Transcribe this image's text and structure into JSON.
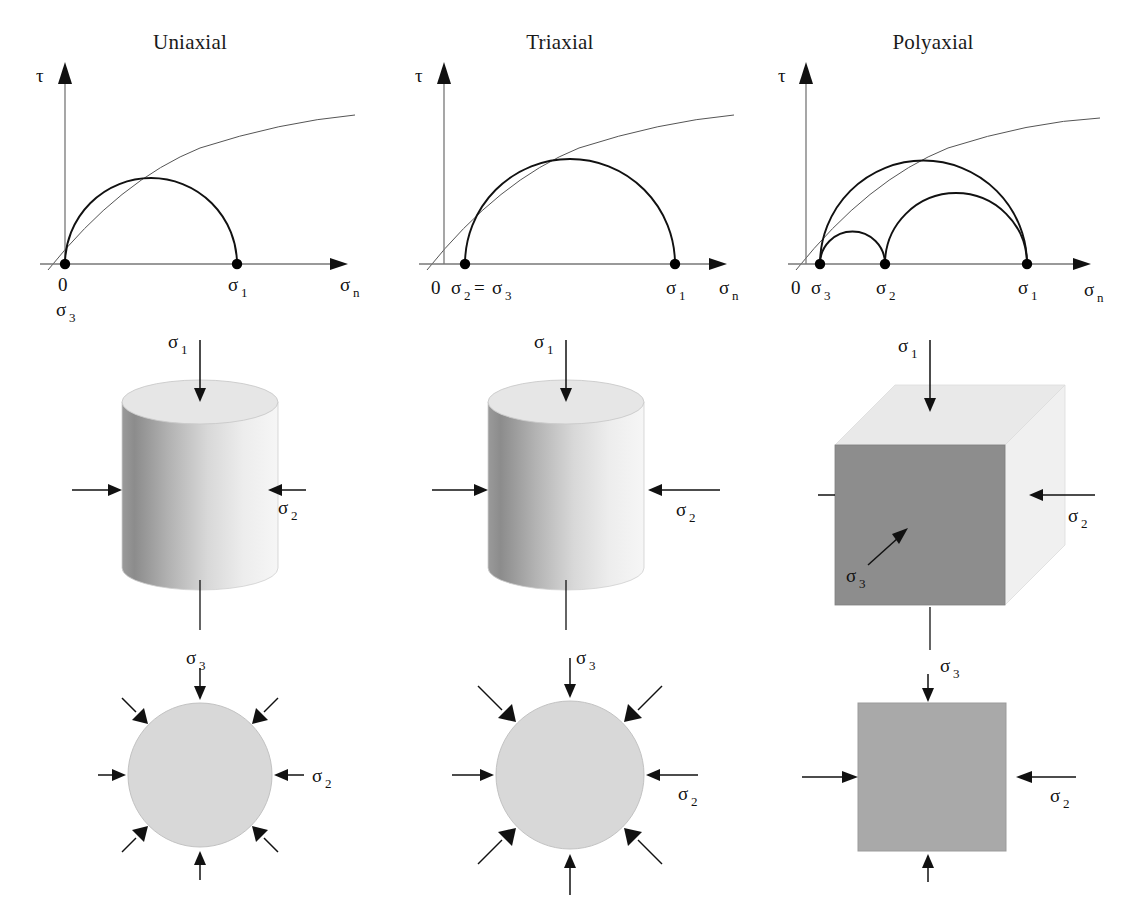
{
  "columns": [
    {
      "key": "uniaxial",
      "title": "Uniaxial",
      "mohr": {
        "tau_label": "τ",
        "sigma_n_label": "σ",
        "sigma_n_sub": "n",
        "origin_label": "0",
        "points": [
          {
            "name": "sigma3",
            "base": "σ",
            "sub": "3",
            "value": 0,
            "label_below_origin": true
          },
          {
            "name": "sigma1",
            "base": "σ",
            "sub": "1",
            "value": 172
          }
        ],
        "circles": [
          {
            "from": 0,
            "to": 172
          }
        ]
      },
      "solid": {
        "shape": "cylinder",
        "axial": {
          "base": "σ",
          "sub": "1"
        },
        "lateral": {
          "base": "σ",
          "sub": "2"
        },
        "lateral_arrow_length": "short"
      },
      "section": {
        "shape": "circle",
        "top": {
          "base": "σ",
          "sub": "3"
        },
        "side": {
          "base": "σ",
          "sub": "2"
        },
        "arrow_count": 8,
        "arrow_length": "short"
      }
    },
    {
      "key": "triaxial",
      "title": "Triaxial",
      "mohr": {
        "tau_label": "τ",
        "sigma_n_label": "σ",
        "sigma_n_sub": "n",
        "origin_label": "0",
        "equality_label": "σ₂ = σ₃",
        "points": [
          {
            "name": "sigma2_sigma3",
            "base": "σ",
            "sub": "2",
            "base2": "σ",
            "sub2": "3",
            "joiner": "=",
            "value": 21
          },
          {
            "name": "sigma1",
            "base": "σ",
            "sub": "1",
            "value": 231
          }
        ],
        "circles": [
          {
            "from": 21,
            "to": 231
          }
        ]
      },
      "solid": {
        "shape": "cylinder",
        "axial": {
          "base": "σ",
          "sub": "1"
        },
        "lateral": {
          "base": "σ",
          "sub": "2"
        },
        "lateral_arrow_length": "long"
      },
      "section": {
        "shape": "circle",
        "top": {
          "base": "σ",
          "sub": "3"
        },
        "side": {
          "base": "σ",
          "sub": "2"
        },
        "arrow_count": 8,
        "arrow_length": "long"
      }
    },
    {
      "key": "polyaxial",
      "title": "Polyaxial",
      "mohr": {
        "tau_label": "τ",
        "sigma_n_label": "σ",
        "sigma_n_sub": "n",
        "origin_label": "0",
        "points": [
          {
            "name": "sigma3",
            "base": "σ",
            "sub": "3",
            "value": 23
          },
          {
            "name": "sigma2",
            "base": "σ",
            "sub": "2",
            "value": 88
          },
          {
            "name": "sigma1",
            "base": "σ",
            "sub": "1",
            "value": 230
          }
        ],
        "circles": [
          {
            "from": 23,
            "to": 230
          },
          {
            "from": 23,
            "to": 88
          },
          {
            "from": 88,
            "to": 230
          }
        ]
      },
      "solid": {
        "shape": "cube",
        "axial": {
          "base": "σ",
          "sub": "1"
        },
        "lateral": {
          "base": "σ",
          "sub": "2"
        },
        "depth": {
          "base": "σ",
          "sub": "3"
        }
      },
      "section": {
        "shape": "square",
        "top": {
          "base": "σ",
          "sub": "3"
        },
        "side": {
          "base": "σ",
          "sub": "2"
        },
        "arrow_count": 4,
        "arrow_length": "long"
      }
    }
  ],
  "colors": {
    "stroke": "#111111",
    "axis": "#777777",
    "envelope": "#555555",
    "cylinder_dark": "#8a8a8a",
    "cylinder_light": "#fbfbfb",
    "cylinder_top": "#e2e2e2",
    "cube_front": "#8d8d8d",
    "cube_top": "#e8e8e8",
    "cube_side": "#efefef",
    "section_fill": "#d6d6d6",
    "square_fill": "#a9a9a9",
    "background": "#ffffff"
  }
}
